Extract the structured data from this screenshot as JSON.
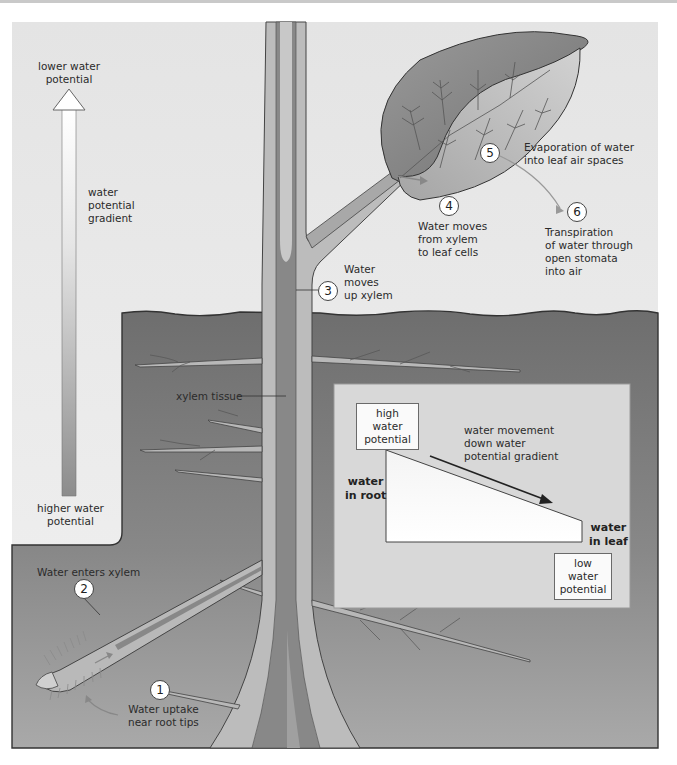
{
  "figure": {
    "colors": {
      "sky": "#ececec",
      "soil": "#7b7b7b",
      "soil_light": "#9a9a9a",
      "xylem_light": "#bdbdbd",
      "xylem_dark": "#858585",
      "leaf_dark": "#8a8a8a",
      "leaf_light": "#c4c4c4",
      "inset_bg": "#d6d6d6",
      "outline": "#3a3a3a"
    }
  },
  "gradient_arrow": {
    "top_label": "lower water potential",
    "top_label_lines": [
      "lower water",
      "potential"
    ],
    "middle_label_lines": [
      "water",
      "potential",
      "gradient"
    ],
    "bottom_label_lines": [
      "higher water",
      "potential"
    ]
  },
  "steps": [
    {
      "number": "1",
      "lines": [
        "Water uptake",
        "near root tips"
      ]
    },
    {
      "number": "2",
      "lines": [
        "Water enters xylem"
      ]
    },
    {
      "number": "3",
      "lines": [
        "Water",
        "moves",
        "up xylem"
      ]
    },
    {
      "number": "4",
      "lines": [
        "Water moves",
        "from xylem",
        "to leaf cells"
      ]
    },
    {
      "number": "5",
      "lines": [
        "Evaporation of water",
        "into leaf air spaces"
      ]
    },
    {
      "number": "6",
      "lines": [
        "Transpiration",
        "of water through",
        "open stomata",
        "into air"
      ]
    }
  ],
  "labels": {
    "xylem_tissue": "xylem tissue"
  },
  "inset": {
    "high_box_lines": [
      "high water",
      "potential"
    ],
    "low_box_lines": [
      "low water",
      "potential"
    ],
    "arrow_label_lines": [
      "water movement",
      "down water",
      "potential gradient"
    ],
    "left_label_lines": [
      "water",
      "in root"
    ],
    "right_label_lines": [
      "water",
      "in leaf"
    ]
  }
}
